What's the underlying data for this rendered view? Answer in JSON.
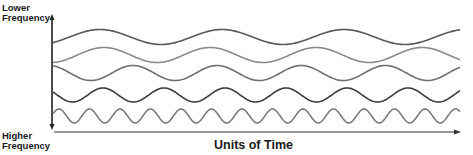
{
  "labels": {
    "top_line1": "Lower",
    "top_line2": "Frequency",
    "bottom_line1": "Higher",
    "bottom_line2": "Frequency",
    "x_axis": "Units of Time"
  },
  "waves": [
    {
      "name": "wave-1",
      "relative_frequency": 1,
      "color": "#5a5a5a"
    },
    {
      "name": "wave-2",
      "relative_frequency": 1.15,
      "color": "#8a8a8a"
    },
    {
      "name": "wave-3",
      "relative_frequency": 1.45,
      "color": "#6e6e6e"
    },
    {
      "name": "wave-4",
      "relative_frequency": 2,
      "color": "#3c3c3c"
    },
    {
      "name": "wave-5",
      "relative_frequency": 4,
      "color": "#7a7a7a"
    }
  ]
}
